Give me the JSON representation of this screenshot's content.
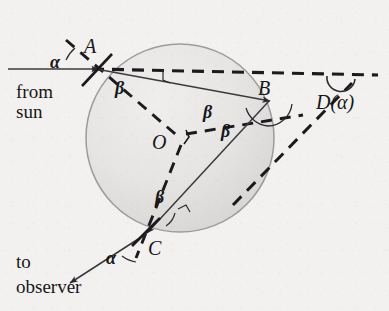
{
  "figure": {
    "background_color": "#f2f1ef",
    "ink_color": "#17161a",
    "drop_fill": "#e3e2e0",
    "drop_stroke": "#9a9a9c"
  },
  "points": {
    "A": {
      "label": "A",
      "x": 96,
      "y": 69
    },
    "B": {
      "label": "B",
      "x": 269,
      "y": 101
    },
    "C": {
      "label": "C",
      "x": 146,
      "y": 234
    },
    "O": {
      "label": "O",
      "x": 180,
      "y": 138
    }
  },
  "labels": {
    "point_a": "A",
    "point_b": "B",
    "point_c": "C",
    "center_o": "O",
    "alpha_at_a": "α",
    "alpha_at_c": "α",
    "beta_at_a": "β",
    "beta_at_b_upper": "β",
    "beta_at_b_lower": "β",
    "beta_at_c": "β",
    "deviation": "D(α)",
    "from_sun_line1": "from",
    "from_sun_line2": "sun",
    "to_observer_line1": "to",
    "to_observer_line2": "observer"
  },
  "drop": {
    "center_x": 180,
    "center_y": 138,
    "radius": 94
  },
  "geometry": {
    "incoming_ray": {
      "x1": 10,
      "y1": 69,
      "x2": 96,
      "y2": 69
    },
    "refracted_ray_AB": {
      "x1": 96,
      "y1": 69,
      "x2": 269,
      "y2": 101
    },
    "reflected_ray_BC": {
      "x1": 269,
      "y1": 101,
      "x2": 146,
      "y2": 234
    },
    "outgoing_ray_C": {
      "x1": 146,
      "y1": 234,
      "x2": 72,
      "y2": 282
    },
    "horizontal_dashed": {
      "x1": 96,
      "y1": 69,
      "x2": 378,
      "y2": 75
    },
    "normal_dashed_at_A": {
      "x1": 68,
      "y1": 42,
      "x2": 180,
      "y2": 138
    },
    "normal_dashed_at_B": {
      "x1": 180,
      "y1": 138,
      "x2": 302,
      "y2": 116
    },
    "normal_dashed_at_C": {
      "x1": 180,
      "y1": 138,
      "x2": 137,
      "y2": 256
    },
    "exit_dashed_BD": {
      "x1": 241,
      "y1": 196,
      "x2": 355,
      "y2": 80
    }
  }
}
